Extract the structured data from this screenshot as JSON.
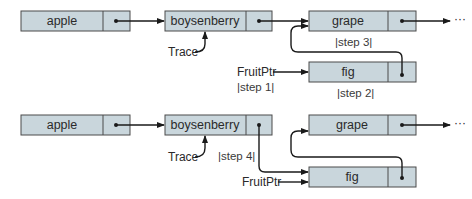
{
  "colors": {
    "node_fill": "#c9d6dc",
    "node_stroke": "#4a4a4a",
    "arrow": "#1a1a1a",
    "text": "#2a2a2a"
  },
  "top_diagram": {
    "nodes": {
      "apple": "apple",
      "boysenberry": "boysenberry",
      "grape": "grape",
      "fig": "fig"
    },
    "labels": {
      "trace": "Trace",
      "fruit_ptr": "FruitPtr",
      "continuation": "···"
    },
    "steps": {
      "step1": "|step 1|",
      "step2": "|step 2|",
      "step3": "|step 3|"
    }
  },
  "bottom_diagram": {
    "nodes": {
      "apple": "apple",
      "boysenberry": "boysenberry",
      "grape": "grape",
      "fig": "fig"
    },
    "labels": {
      "trace": "Trace",
      "fruit_ptr": "FruitPtr",
      "continuation": "···"
    },
    "steps": {
      "step4": "|step 4|"
    }
  }
}
